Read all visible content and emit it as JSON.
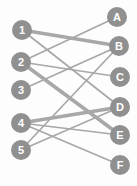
{
  "diagram": {
    "type": "bipartite-graph",
    "background": "#fdfdfd",
    "width": 137,
    "height": 186,
    "node_color": "#909090",
    "node_label_color": "#ffffff",
    "node_radius": 10,
    "node_label_font_size": 11,
    "edge_color": "#a8a8a8",
    "edge_width_normal": 1.7,
    "edge_width_thick": 3.6,
    "left_nodes": [
      {
        "id": "1",
        "label": "1",
        "x": 22,
        "y": 30
      },
      {
        "id": "2",
        "label": "2",
        "x": 21,
        "y": 62
      },
      {
        "id": "3",
        "label": "3",
        "x": 21,
        "y": 90
      },
      {
        "id": "4",
        "label": "4",
        "x": 21,
        "y": 123
      },
      {
        "id": "5",
        "label": "5",
        "x": 21,
        "y": 150
      }
    ],
    "right_nodes": [
      {
        "id": "A",
        "label": "A",
        "x": 117,
        "y": 17
      },
      {
        "id": "B",
        "label": "B",
        "x": 119,
        "y": 46
      },
      {
        "id": "C",
        "label": "C",
        "x": 120,
        "y": 77
      },
      {
        "id": "D",
        "label": "D",
        "x": 120,
        "y": 107
      },
      {
        "id": "E",
        "label": "E",
        "x": 120,
        "y": 135
      },
      {
        "id": "F",
        "label": "F",
        "x": 120,
        "y": 165
      }
    ],
    "edges": [
      {
        "from": "1",
        "to": "B",
        "thick": true
      },
      {
        "from": "1",
        "to": "D",
        "thick": false
      },
      {
        "from": "2",
        "to": "A",
        "thick": false
      },
      {
        "from": "2",
        "to": "C",
        "thick": false
      },
      {
        "from": "2",
        "to": "E",
        "thick": true
      },
      {
        "from": "3",
        "to": "B",
        "thick": false
      },
      {
        "from": "4",
        "to": "D",
        "thick": true
      },
      {
        "from": "4",
        "to": "E",
        "thick": false
      },
      {
        "from": "4",
        "to": "F",
        "thick": false
      },
      {
        "from": "5",
        "to": "B",
        "thick": false
      },
      {
        "from": "5",
        "to": "D",
        "thick": false
      }
    ]
  }
}
